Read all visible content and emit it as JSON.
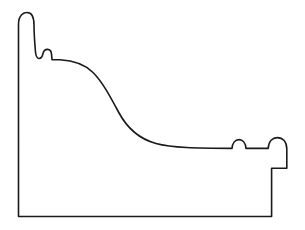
{
  "document": {
    "kind": "technical-line-drawing",
    "subject": "picture frame moulding cross-section profile",
    "title": "Moulding Profile",
    "orientation": "rabbet at lower right, face sweeping up to raised outer lip at left"
  },
  "canvas": {
    "width": 305,
    "height": 230,
    "background_color": "#ffffff"
  },
  "drawing": {
    "stroke_color": "#1a1a1a",
    "fill_color": "#ffffff",
    "stroke_width": 1.6,
    "path": "M 18.5 216.5 L 18.5 24.5 C 18.5 14.5 24.0 12.5 27.0 12.5 C 30.5 12.5 34.0 15.5 34.0 25.0 C 34.0 35.0 35.0 46.0 35.5 52.0 C 36.0 56.5 37.0 58.5 39.0 58.5 C 41.5 58.5 42.5 56.0 43.0 53.5 C 43.6 51.0 45.5 49.3 47.6 49.4 C 49.8 49.5 51.3 51.4 51.5 54.0 L 52.0 59.6 L 60.0 59.8 C 74.0 60.6 84.5 64.0 93.0 72.5 C 102.5 82.0 110.0 96.0 118.5 112.0 C 127.5 129.0 139.5 139.0 156.0 143.5 C 172.0 147.8 196.0 148.3 232.0 148.4 C 232.4 143.0 235.2 139.6 239.0 139.6 C 242.8 139.6 245.6 143.0 246.0 148.4 L 268.2 148.4 C 268.6 141.2 272.6 137.6 277.4 137.6 C 282.4 137.6 286.5 141.2 286.8 148.6 L 286.8 168.2 L 271.6 168.2 L 271.6 216.5 Z",
    "features": [
      {
        "name": "outer-lip-crest",
        "description": "rounded raised outer lip at top left",
        "x": 27,
        "y": 13
      },
      {
        "name": "left-back-edge",
        "description": "straight vertical back edge of moulding",
        "x": 18,
        "y": 120
      },
      {
        "name": "upper-step-bead",
        "description": "small bead notch below outer lip",
        "x": 39,
        "y": 58
      },
      {
        "name": "second-bead",
        "description": "second small bead forming a quirk",
        "x": 48,
        "y": 49
      },
      {
        "name": "ogee-sweep",
        "description": "long S-curve sweeping down toward the sight edge",
        "x": 120,
        "y": 112
      },
      {
        "name": "inner-bead-one",
        "description": "small half-round bead near sight edge",
        "x": 239,
        "y": 140
      },
      {
        "name": "inner-bead-two",
        "description": "second half-round bead at sight edge",
        "x": 277,
        "y": 138
      },
      {
        "name": "rabbet-step",
        "description": "rabbet / rebate notch at lower right",
        "x": 279,
        "y": 168
      },
      {
        "name": "bottom-edge",
        "description": "flat bottom face of the moulding",
        "x": 145,
        "y": 216
      }
    ]
  }
}
